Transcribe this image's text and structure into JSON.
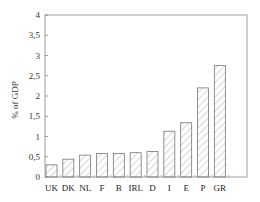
{
  "chart_data": {
    "type": "bar",
    "title": "",
    "xlabel": "",
    "ylabel": "% of GDP",
    "ylim": [
      0,
      4
    ],
    "yticks": [
      "0",
      "0,5",
      "1",
      "1,5",
      "2",
      "2,5",
      "3",
      "3,5",
      "4"
    ],
    "ytick_values": [
      0,
      0.5,
      1,
      1.5,
      2,
      2.5,
      3,
      3.5,
      4
    ],
    "grid": false,
    "legend": null,
    "bar_style": "hatched",
    "categories": [
      "UK",
      "DK",
      "NL",
      "F",
      "B",
      "IRL",
      "D",
      "I",
      "E",
      "P",
      "GR"
    ],
    "values": [
      0.3,
      0.44,
      0.54,
      0.58,
      0.58,
      0.6,
      0.63,
      1.13,
      1.34,
      2.2,
      2.75
    ]
  },
  "colors": {
    "axis": "#888888",
    "bar_outline": "#777777",
    "hatch": "#999999",
    "background": "#ffffff"
  }
}
